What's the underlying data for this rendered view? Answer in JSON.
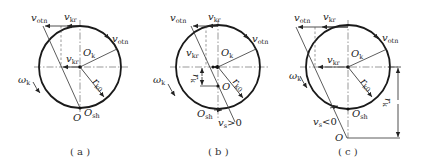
{
  "figure": {
    "panels": [
      {
        "id": "a",
        "caption": "( a )",
        "labels": {
          "v_otn_top": {
            "main": "v",
            "sub": "otn"
          },
          "v_kr_top": {
            "main": "v",
            "sub": "kr"
          },
          "v_otn_right": {
            "main": "v",
            "sub": "otn"
          },
          "O_k": {
            "main": "O",
            "sub": "k"
          },
          "v_kr_mid": {
            "main": "v",
            "sub": "kr"
          },
          "omega_k": {
            "main": "ω",
            "sub": "k"
          },
          "r_k0": {
            "main": "r",
            "sub": "k0"
          },
          "O": {
            "main": "O",
            "sub": ""
          },
          "O_sh": {
            "main": "O",
            "sub": "sh"
          }
        }
      },
      {
        "id": "b",
        "caption": "( b )",
        "labels": {
          "v_otn_top": {
            "main": "v",
            "sub": "otn"
          },
          "v_kr_top": {
            "main": "v",
            "sub": "kr"
          },
          "v_otn_right": {
            "main": "v",
            "sub": "otn"
          },
          "O_k": {
            "main": "O",
            "sub": "k"
          },
          "v_kr_mid": {
            "main": "v",
            "sub": "kr"
          },
          "omega_k": {
            "main": "ω",
            "sub": "k"
          },
          "r_k": {
            "main": "r",
            "sub": "k"
          },
          "r_k0": {
            "main": "r",
            "sub": "k0"
          },
          "O": {
            "main": "O",
            "sub": ""
          },
          "O_sh": {
            "main": "O",
            "sub": "sh"
          },
          "v_s": {
            "main": "v",
            "sub": "s",
            "suffix": ">0"
          }
        }
      },
      {
        "id": "c",
        "caption": "( c )",
        "labels": {
          "v_otn_top": {
            "main": "v",
            "sub": "otn"
          },
          "v_kr_top": {
            "main": "v",
            "sub": "kr"
          },
          "v_otn_right": {
            "main": "v",
            "sub": "otn"
          },
          "O_k": {
            "main": "O",
            "sub": "k"
          },
          "v_kr_mid": {
            "main": "v",
            "sub": "kr"
          },
          "omega_k": {
            "main": "ω",
            "sub": "k"
          },
          "r_k0": {
            "main": "r",
            "sub": "k0"
          },
          "r_k": {
            "main": "r",
            "sub": "k"
          },
          "O": {
            "main": "O",
            "sub": ""
          },
          "O_sh": {
            "main": "O",
            "sub": "sh"
          },
          "v_s": {
            "main": "v",
            "sub": "s",
            "suffix": "<0"
          }
        }
      }
    ]
  }
}
